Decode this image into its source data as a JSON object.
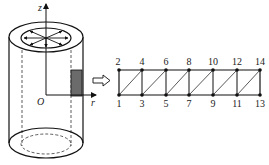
{
  "figure": {
    "cylinder": {
      "axis_labels": {
        "z": "z",
        "r": "r",
        "origin": "O"
      },
      "shaded_element": "rectangular cross-section strip",
      "radial_arrows": 8
    },
    "transition_arrow": "hollow-right-arrow",
    "mesh": {
      "top_nodes": [
        {
          "id": "2",
          "label": "2"
        },
        {
          "id": "4",
          "label": "4"
        },
        {
          "id": "6",
          "label": "6"
        },
        {
          "id": "8",
          "label": "8"
        },
        {
          "id": "10",
          "label": "10"
        },
        {
          "id": "12",
          "label": "12"
        },
        {
          "id": "14",
          "label": "14"
        }
      ],
      "bottom_nodes": [
        {
          "id": "1",
          "label": "1"
        },
        {
          "id": "3",
          "label": "3"
        },
        {
          "id": "5",
          "label": "5"
        },
        {
          "id": "7",
          "label": "7"
        },
        {
          "id": "9",
          "label": "9"
        },
        {
          "id": "11",
          "label": "11"
        },
        {
          "id": "13",
          "label": "13"
        }
      ],
      "element_count": 12,
      "element_type": "triangular"
    }
  }
}
